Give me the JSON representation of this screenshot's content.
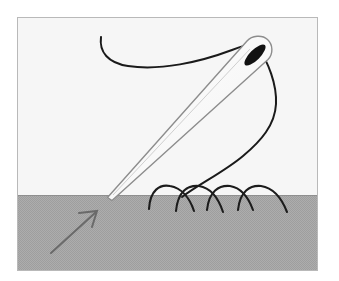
{
  "figure": {
    "title": "Hand sewing a running stitch with threaded needle",
    "type": "line-illustration",
    "canvas": {
      "width": 339,
      "height": 281
    },
    "frame": {
      "x": 17,
      "y": 17,
      "width": 301,
      "height": 254,
      "border_color": "#b4b4b4",
      "border_width": 1
    },
    "palette": {
      "background_above_fabric": "#f5f5f5",
      "fabric_gray": "#a9a9a9",
      "fabric_texture_gray": "#9f9f9f",
      "thread_black": "#1a1a1a",
      "needle_outline_gray": "#8a8a8a",
      "needle_body_white": "#fdfdfd",
      "needle_eye_black": "#111111",
      "arrow_gray": "#6e6e6e"
    },
    "fabric": {
      "label": "fabric-surface",
      "top_edge_y": 195,
      "fill": "#a9a9a9"
    },
    "needle": {
      "label": "sewing-needle",
      "tip_point": {
        "x": 108,
        "y": 197
      },
      "head_point": {
        "x": 268,
        "y": 43
      },
      "angle_degrees": 44,
      "eye": {
        "cx": 255,
        "cy": 55,
        "rx": 13,
        "ry": 5,
        "rotation_degrees": -44
      }
    },
    "thread": {
      "label": "thread",
      "tail_start": {
        "x": 102,
        "y": 36
      },
      "passes_through_eye": true,
      "loop_rightmost_x": 276,
      "enters_fabric_at": {
        "x": 180,
        "y": 198
      }
    },
    "stitches": {
      "label": "running-stitches",
      "count": 4,
      "arc_tops_y": 186,
      "arcs": [
        {
          "start_x": 149,
          "peak_x": 168,
          "end_x": 193
        },
        {
          "start_x": 176,
          "peak_x": 198,
          "end_x": 222
        },
        {
          "start_x": 206,
          "peak_x": 228,
          "end_x": 252
        },
        {
          "start_x": 237,
          "peak_x": 259,
          "end_x": 285
        }
      ]
    },
    "direction_arrow": {
      "label": "stitch-direction-arrow",
      "tail": {
        "x": 51,
        "y": 252
      },
      "head": {
        "x": 95,
        "y": 213
      },
      "points": "up-right",
      "meaning": "direction of sewing"
    }
  }
}
